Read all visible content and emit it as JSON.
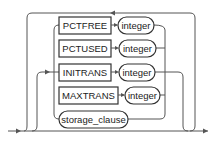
{
  "diagram": {
    "type": "railroad-syntax",
    "keywords": [
      {
        "label": "PCTFREE",
        "param": "integer"
      },
      {
        "label": "PCTUSED",
        "param": "integer"
      },
      {
        "label": "INITRANS",
        "param": "integer"
      },
      {
        "label": "MAXTRANS",
        "param": "integer"
      }
    ],
    "clause": {
      "label": "storage_clause"
    },
    "colors": {
      "line": "#555555",
      "box": "#333333",
      "text": "#222222"
    }
  }
}
